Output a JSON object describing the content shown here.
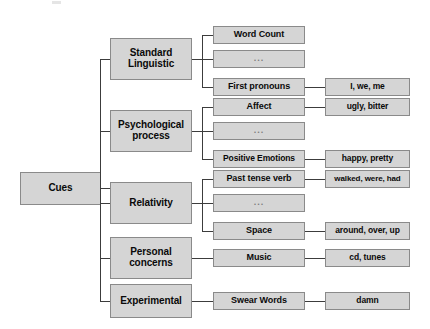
{
  "diagram": {
    "root": {
      "label": "Cues"
    },
    "colors": {
      "box_fill": "#d5d5d5",
      "box_border": "#8a8a8a",
      "line": "#3c3c3c",
      "text": "#0a0a0a",
      "background": "#ffffff"
    },
    "ellipsis_label": "...",
    "categories": [
      {
        "label": "Standard\nLinguistic",
        "subcategories": [
          {
            "label": "Word Count",
            "examples": ""
          },
          {
            "label": "...",
            "examples": "",
            "is_ellipsis": true
          },
          {
            "label": "First pronouns",
            "examples": "I, we, me"
          }
        ]
      },
      {
        "label": "Psychological\nprocess",
        "subcategories": [
          {
            "label": "Affect",
            "examples": "ugly, bitter"
          },
          {
            "label": "...",
            "examples": "",
            "is_ellipsis": true
          },
          {
            "label": "Positive Emotions",
            "examples": "happy, pretty"
          }
        ]
      },
      {
        "label": "Relativity",
        "subcategories": [
          {
            "label": "Past tense verb",
            "examples": "walked, were, had"
          },
          {
            "label": "...",
            "examples": "",
            "is_ellipsis": true
          },
          {
            "label": "Space",
            "examples": "around, over, up"
          }
        ]
      },
      {
        "label": "Personal\nconcerns",
        "subcategories": [
          {
            "label": "Music",
            "examples": "cd, tunes"
          }
        ]
      },
      {
        "label": "Experimental",
        "subcategories": [
          {
            "label": "Swear Words",
            "examples": "damn"
          }
        ]
      }
    ]
  }
}
